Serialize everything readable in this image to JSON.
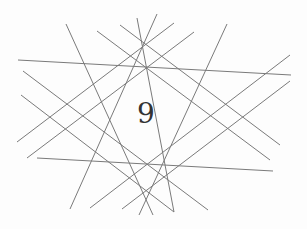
{
  "label": "9",
  "line_color": "#7a7a7a",
  "lines": [
    [
      18,
      60,
      291,
      75
    ],
    [
      37,
      158,
      273,
      171
    ],
    [
      66,
      24,
      153,
      215
    ],
    [
      97,
      31,
      270,
      160
    ],
    [
      120,
      25,
      280,
      145
    ],
    [
      137,
      18,
      174,
      212
    ],
    [
      157,
      14,
      70,
      209
    ],
    [
      174,
      23,
      17,
      142
    ],
    [
      194,
      32,
      27,
      158
    ],
    [
      227,
      24,
      139,
      215
    ],
    [
      290,
      55,
      90,
      208
    ],
    [
      290,
      81,
      122,
      209
    ],
    [
      23,
      71,
      208,
      210
    ],
    [
      21,
      95,
      174,
      212
    ]
  ]
}
